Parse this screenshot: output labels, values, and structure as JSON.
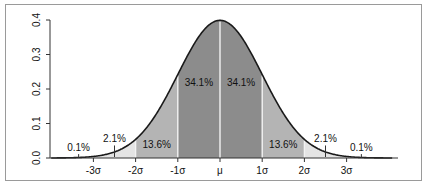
{
  "chart_data": {
    "type": "area",
    "title": "",
    "subtitle": "",
    "xlabel": "",
    "ylabel": "",
    "x_tick_labels": [
      "-3σ",
      "-2σ",
      "-1σ",
      "μ",
      "1σ",
      "2σ",
      "3σ"
    ],
    "x_ticks": [
      -3,
      -2,
      -1,
      0,
      1,
      2,
      3
    ],
    "y_tick_labels": [
      "0.0",
      "0.1",
      "0.2",
      "0.3",
      "0.4"
    ],
    "y_ticks": [
      0.0,
      0.1,
      0.2,
      0.3,
      0.4
    ],
    "xlim": [
      -4.1,
      4.3
    ],
    "ylim": [
      0,
      0.4
    ],
    "grid": false,
    "legend": null,
    "curve": {
      "function": "normal_pdf",
      "mean": 0,
      "sd": 1,
      "peak": 0.399
    },
    "bands": [
      {
        "from": -4,
        "to": -3,
        "label": "0.1%",
        "value": 0.1,
        "color": "#ffffff"
      },
      {
        "from": -3,
        "to": -2,
        "label": "2.1%",
        "value": 2.1,
        "color": "#e4e4e4"
      },
      {
        "from": -2,
        "to": -1,
        "label": "13.6%",
        "value": 13.6,
        "color": "#b4b4b4"
      },
      {
        "from": -1,
        "to": 0,
        "label": "34.1%",
        "value": 34.1,
        "color": "#8c8c8c"
      },
      {
        "from": 0,
        "to": 1,
        "label": "34.1%",
        "value": 34.1,
        "color": "#8c8c8c"
      },
      {
        "from": 1,
        "to": 2,
        "label": "13.6%",
        "value": 13.6,
        "color": "#b4b4b4"
      },
      {
        "from": 2,
        "to": 3,
        "label": "2.1%",
        "value": 2.1,
        "color": "#e4e4e4"
      },
      {
        "from": 3,
        "to": 4,
        "label": "0.1%",
        "value": 0.1,
        "color": "#ffffff"
      }
    ],
    "annotations": [
      {
        "text": "0.1%",
        "x": -3.35,
        "y": 0.02,
        "leader": true
      },
      {
        "text": "2.1%",
        "x": -2.5,
        "y": 0.045,
        "leader": true
      },
      {
        "text": "13.6%",
        "x": -1.5,
        "y": 0.03,
        "leader": false
      },
      {
        "text": "34.1%",
        "x": -0.5,
        "y": 0.21,
        "leader": false
      },
      {
        "text": "34.1%",
        "x": 0.5,
        "y": 0.21,
        "leader": false
      },
      {
        "text": "13.6%",
        "x": 1.5,
        "y": 0.03,
        "leader": false
      },
      {
        "text": "2.1%",
        "x": 2.5,
        "y": 0.045,
        "leader": true
      },
      {
        "text": "0.1%",
        "x": 3.35,
        "y": 0.02,
        "leader": true
      }
    ]
  },
  "colors": {
    "curve": "#1a1a1a",
    "axis": "#333333",
    "divider": "#f2f2f2",
    "frame": "#9a9a9a"
  }
}
